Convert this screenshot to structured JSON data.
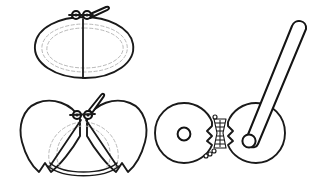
{
  "image": {
    "title": "Hinged clamshell device — three views",
    "background_color": "#ffffff",
    "line_color": "#1a1a1a",
    "hidden_line_color": "#b9b9b9",
    "width": 328,
    "height": 185
  },
  "figures": [
    {
      "id": "fig-closed-top",
      "label": "Closed clamshell, plan view",
      "position": "top-left",
      "parts": [
        {
          "name": "shell-outline",
          "label": "Oval shell outline"
        },
        {
          "name": "shell-hidden-seam",
          "label": "Hidden inner seam (dashed)"
        },
        {
          "name": "center-seam",
          "label": "Vertical center seam"
        },
        {
          "name": "pivot-assembly",
          "label": "Double eyelet pivot"
        },
        {
          "name": "lever-handle",
          "label": "Folded lever handle"
        }
      ]
    },
    {
      "id": "fig-open-bottom",
      "label": "Opened clamshell, plan view",
      "position": "bottom-left",
      "parts": [
        {
          "name": "left-wing",
          "label": "Left shell wing"
        },
        {
          "name": "right-wing",
          "label": "Right shell wing"
        },
        {
          "name": "hidden-fold-arcs",
          "label": "Hidden fold arcs (dashed)"
        },
        {
          "name": "lower-rim-arc",
          "label": "Lower rim double arc"
        },
        {
          "name": "pivot-assembly",
          "label": "Double eyelet pivot"
        },
        {
          "name": "lever-handle",
          "label": "Folded lever handle"
        }
      ]
    },
    {
      "id": "fig-discs-right",
      "label": "Paired discs with hinge and lever, elevation view",
      "position": "right",
      "parts": [
        {
          "name": "left-disc",
          "label": "Left disc"
        },
        {
          "name": "left-disc-hub",
          "label": "Left disc center hole"
        },
        {
          "name": "right-disc",
          "label": "Right disc"
        },
        {
          "name": "right-disc-hub",
          "label": "Right disc pivot hole"
        },
        {
          "name": "knurled-hinge",
          "label": "Knurled hinge column"
        },
        {
          "name": "lever-arm",
          "label": "Long lever arm with rounded tip"
        }
      ]
    }
  ]
}
